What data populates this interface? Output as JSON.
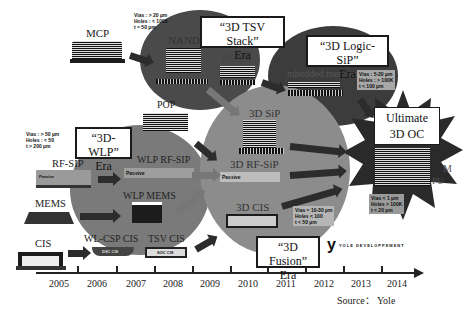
{
  "eras": {
    "wlp": {
      "title": "“3D-WLP”",
      "sub": "Era"
    },
    "tsv": {
      "title": "“3D TSV Stack”",
      "sub": "Era"
    },
    "logic": {
      "title": "“3D Logic-SiP”",
      "sub": "Era"
    },
    "fusion": {
      "title": "“3D Fusion”",
      "sub": "Era"
    },
    "ultimate": {
      "title": "Ultimate",
      "sub": "3D OC"
    }
  },
  "packages": {
    "mcp": "MCP",
    "pop": "POP",
    "rf_sip": "RF-SIP",
    "mems": "MEMS",
    "cis": "CIS",
    "nand": "NAND",
    "dram": "DRAM",
    "embedded_memory": "mbedded memory",
    "wlp_rf_sip": "WLP RF-SIP",
    "wlp_mems": "WLP MEMS",
    "wl_csp_cis": "WL-CSP CIS",
    "tsv_cis": "TSV CIS",
    "sip_3d": "3D SiP",
    "rf_sip_3d": "3D RF-SiP",
    "cis_3d": "3D CIS",
    "passive": "Passive",
    "active_die": "Active die",
    "dsp_cis": "DSC CIS",
    "soc_cis": "SOC CIS",
    "frag_m": "M",
    "frag_pu": "PU"
  },
  "specs": {
    "tsv": [
      "Vias : > 20 µm",
      "Holes : < 1000",
      "t = 50 µm"
    ],
    "wlp": [
      "Vias : > 50 µm",
      "Holes : < 50",
      "t > 200 µm"
    ],
    "logic": [
      "Vias : 5-20 µm",
      "Holes : > 100K",
      "t < 100 µm"
    ],
    "fusion": [
      "Vias = 10-30 µm",
      "Holes < 100",
      "t < 50 µm"
    ],
    "ultimate": [
      "Vias < 1 µm",
      "Holes > 100K",
      "t < 20 µm"
    ]
  },
  "timeline": {
    "years": [
      "2005",
      "2006",
      "2007",
      "2008",
      "2009",
      "2010",
      "2011",
      "2012",
      "2013",
      "2014"
    ],
    "source": "Source： Yole"
  },
  "logo": {
    "mark": "y",
    "text": "YOLE DEVELOPPEMENT"
  }
}
